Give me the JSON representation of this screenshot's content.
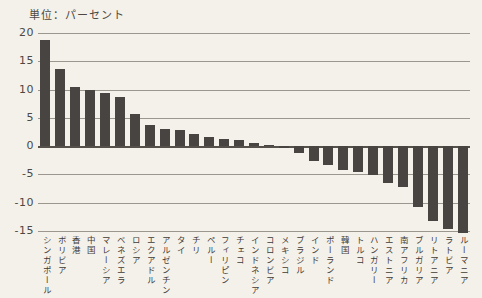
{
  "page": {
    "background": "#f4f1ea",
    "unit_label": "単位：パーセント"
  },
  "chart_data": {
    "type": "bar",
    "title": "単位：パーセント",
    "xlabel": "",
    "ylabel": "パーセント",
    "ylim": [
      -15,
      20
    ],
    "yticks": [
      20,
      15,
      10,
      5,
      0,
      -5,
      -10,
      -15
    ],
    "grid": true,
    "legend": "none",
    "bar_color": "#474441",
    "categories": [
      "シンガポール",
      "ボリビア",
      "香港",
      "中国",
      "マレーシア",
      "ベネズエラ",
      "ロシア",
      "エクアドル",
      "アルゼンチン",
      "タイ",
      "チリ",
      "ペルー",
      "フィリピン",
      "チェコ",
      "インドネシア",
      "コロンビア",
      "メキシコ",
      "ブラジル",
      "インド",
      "ポーランド",
      "韓国",
      "トルコ",
      "ハンガリー",
      "エストニア",
      "南アフリカ",
      "ブルガリア",
      "リトアニア",
      "ラトビア",
      "ルーマニア"
    ],
    "values": [
      18.7,
      13.7,
      10.5,
      10.0,
      9.4,
      8.7,
      5.7,
      3.8,
      3.1,
      2.9,
      2.2,
      1.6,
      1.2,
      1.0,
      0.6,
      0.2,
      -0.3,
      -1.2,
      -2.6,
      -3.4,
      -4.3,
      -4.6,
      -5.1,
      -6.6,
      -7.2,
      -10.7,
      -13.3,
      -14.7,
      -15.3
    ]
  }
}
